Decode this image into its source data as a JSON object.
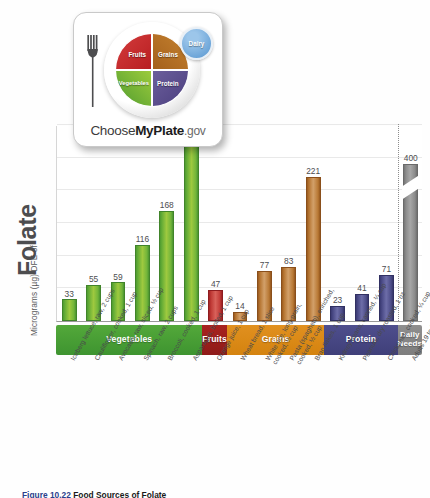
{
  "figure": {
    "caption_label": "Figure",
    "caption_number": "10.22",
    "caption_title": "Food Sources of Folate"
  },
  "yaxis": {
    "small_label": "Micrograms (µg) DFE of",
    "big_label": "Folate"
  },
  "logo": {
    "name": "ChooseMyPlate.gov",
    "text_prefix": "Choose",
    "text_bold": "MyPlate",
    "text_suffix": ".gov",
    "segments": [
      {
        "key": "fruits",
        "label": "Fruits",
        "color": "#c62f2f"
      },
      {
        "key": "grains",
        "label": "Grains",
        "color": "#b5712a"
      },
      {
        "key": "vegetables",
        "label": "Vegetables",
        "color": "#76b338"
      },
      {
        "key": "protein",
        "label": "Protein",
        "color": "#5b4f8e"
      },
      {
        "key": "dairy",
        "label": "Dairy",
        "color": "#6ba4d8"
      }
    ]
  },
  "categories": [
    {
      "name": "Vegetables",
      "color": "#4a9e34",
      "span": 6
    },
    {
      "name": "Fruits",
      "color": "#9c1f1c",
      "span": 1
    },
    {
      "name": "Grains",
      "color": "#d9881a",
      "span": 4
    },
    {
      "name": "Protein",
      "color": "#46467f",
      "span": 3
    },
    {
      "name": "Daily Needs",
      "color": "#858585",
      "span": 1
    }
  ],
  "chart_data": {
    "type": "bar",
    "title": "Food Sources of Folate",
    "xlabel": "",
    "ylabel": "Micrograms (µg) DFE of Folate",
    "ylim": [
      0,
      300
    ],
    "yaxis_broken": true,
    "broken_bar_value": 400,
    "grid": true,
    "gridlines": [
      50,
      100,
      150,
      200,
      250,
      300
    ],
    "categories": [
      "Iceberg lettuce, raw, 2 cups",
      "Cauliflower, cooked, 1 cup",
      "Avocado, raw, sliced, ½ cup",
      "Spinach, raw, 2 cups",
      "Broccoli, cooked, 1 cup",
      "Asparagus, boiled, 1 cup",
      "Orange juice, 1 cup",
      "Wheat bread, 1 slice",
      "White rice, long-grain, cooked, ½ cup",
      "Pasta (spaghetti), enriched, cooked, ½ cup",
      "Bran flakes, 1 cup",
      "Kidney beans, canned, ¼ cup",
      "Peanuts, dry roasted, 1 oz",
      "Chickpeas, cooked, ¼ cup",
      "Adults 19 to 50 years"
    ],
    "values": [
      33,
      55,
      59,
      116,
      168,
      268,
      47,
      14,
      77,
      83,
      221,
      23,
      41,
      71,
      400
    ],
    "groups": [
      "Vegetables",
      "Vegetables",
      "Vegetables",
      "Vegetables",
      "Vegetables",
      "Vegetables",
      "Fruits",
      "Grains",
      "Grains",
      "Grains",
      "Grains",
      "Protein",
      "Protein",
      "Protein",
      "Daily Needs"
    ],
    "bars": [
      {
        "label": "Iceberg lettuce, raw, 2 cups",
        "label_lines": [
          "Iceberg lettuce, raw, 2 cups"
        ],
        "value": 33,
        "group": "Vegetables",
        "color": "#76b338"
      },
      {
        "label": "Cauliflower, cooked, 1 cup",
        "label_lines": [
          "Cauliflower, cooked, 1 cup"
        ],
        "value": 55,
        "group": "Vegetables",
        "color": "#76b338"
      },
      {
        "label": "Avocado, raw, sliced, ½ cup",
        "label_lines": [
          "Avocado, raw, sliced, ½ cup"
        ],
        "value": 59,
        "group": "Vegetables",
        "color": "#76b338"
      },
      {
        "label": "Spinach, raw, 2 cups",
        "label_lines": [
          "Spinach, raw, 2 cups"
        ],
        "value": 116,
        "group": "Vegetables",
        "color": "#76b338"
      },
      {
        "label": "Broccoli, cooked, 1 cup",
        "label_lines": [
          "Broccoli, cooked, 1 cup"
        ],
        "value": 168,
        "group": "Vegetables",
        "color": "#76b338"
      },
      {
        "label": "Asparagus, boiled, 1 cup",
        "label_lines": [
          "Asparagus, boiled, 1 cup"
        ],
        "value": 268,
        "group": "Vegetables",
        "color": "#76b338"
      },
      {
        "label": "Orange juice, 1 cup",
        "label_lines": [
          "Orange juice, 1 cup"
        ],
        "value": 47,
        "group": "Fruits",
        "color": "#c03a36"
      },
      {
        "label": "Wheat bread, 1 slice",
        "label_lines": [
          "Wheat bread, 1 slice"
        ],
        "value": 14,
        "group": "Grains",
        "color": "#c5924f"
      },
      {
        "label": "White rice, long-grain, cooked, ½ cup",
        "label_lines": [
          "White rice, long-grain,",
          "cooked, ½ cup"
        ],
        "value": 77,
        "group": "Grains",
        "color": "#c5924f"
      },
      {
        "label": "Pasta (spaghetti), enriched, cooked, ½ cup",
        "label_lines": [
          "Pasta (spaghetti), enriched,",
          "cooked, ½ cup"
        ],
        "value": 83,
        "group": "Grains",
        "color": "#c5924f"
      },
      {
        "label": "Bran flakes, 1 cup",
        "label_lines": [
          "Bran flakes, 1 cup"
        ],
        "value": 221,
        "group": "Grains",
        "color": "#c5924f"
      },
      {
        "label": "Kidney beans, canned, ¼ cup",
        "label_lines": [
          "Kidney beans, canned, ¼ cup"
        ],
        "value": 23,
        "group": "Protein",
        "color": "#5b5b95"
      },
      {
        "label": "Peanuts, dry roasted, 1 oz",
        "label_lines": [
          "Peanuts, dry roasted, 1 oz"
        ],
        "value": 41,
        "group": "Protein",
        "color": "#5b5b95"
      },
      {
        "label": "Chickpeas, cooked, ¼ cup",
        "label_lines": [
          "Chickpeas, cooked, ¼ cup"
        ],
        "value": 71,
        "group": "Protein",
        "color": "#5b5b95"
      },
      {
        "label": "Adults 19 to 50 years",
        "label_lines": [
          "Adults 19 to 50 years"
        ],
        "value": 400,
        "group": "Daily Needs",
        "color": "#949494"
      }
    ]
  }
}
